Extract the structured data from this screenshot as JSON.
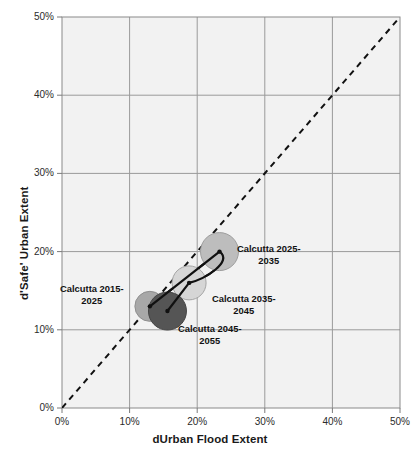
{
  "chart_data": {
    "type": "scatter",
    "title": "",
    "xlabel": "dUrban Flood Extent",
    "ylabel": "d'Safe' Urban Extent",
    "xlim": [
      0,
      50
    ],
    "ylim": [
      0,
      50
    ],
    "xticks": [
      "0%",
      "10%",
      "20%",
      "30%",
      "40%",
      "50%"
    ],
    "yticks": [
      "0%",
      "10%",
      "20%",
      "30%",
      "40%",
      "50%"
    ],
    "xtick_values": [
      0,
      10,
      20,
      30,
      40,
      50
    ],
    "ytick_values": [
      0,
      10,
      20,
      30,
      40,
      50
    ],
    "grid": true,
    "legend": "none",
    "units": "percent",
    "reference_line": {
      "name": "one-to-one-line",
      "style": "dashed",
      "from": [
        0,
        0
      ],
      "to": [
        50,
        50
      ]
    },
    "connector": {
      "name": "trajectory-path",
      "style": "solid",
      "order": [
        "Calcutta 2015-2025",
        "Calcutta 2025-2035",
        "Calcutta 2035-2045",
        "Calcutta 2045-2055"
      ]
    },
    "points": [
      {
        "label": "Calcutta 2015-2025",
        "label_line1": "Calcutta 2015-",
        "label_line2": "2025",
        "x": 13.0,
        "y": 13.0,
        "radius_px": 15,
        "fill": "#a8a8a8",
        "stroke": "#8f8f8f",
        "label_x_px": 60,
        "label_y_px": 283,
        "label_align": "center"
      },
      {
        "label": "Calcutta 2025-2035",
        "label_line1": "Calcutta 2025-",
        "label_line2": "2035",
        "x": 23.3,
        "y": 20.0,
        "radius_px": 19,
        "fill": "#bdbdbd",
        "stroke": "#9e9e9e",
        "label_x_px": 237,
        "label_y_px": 243,
        "label_align": "left"
      },
      {
        "label": "Calcutta 2035-2045",
        "label_line1": "Calcutta 2035-",
        "label_line2": "2045",
        "x": 18.8,
        "y": 16.0,
        "radius_px": 17,
        "fill": "#d6d6d6",
        "stroke": "#a5a5a5",
        "label_x_px": 212,
        "label_y_px": 293,
        "label_align": "left"
      },
      {
        "label": "Calcutta 2045-2055",
        "label_line1": "Calcutta 2045-",
        "label_line2": "2055",
        "x": 15.6,
        "y": 12.4,
        "radius_px": 19,
        "fill": "#555555",
        "stroke": "#444444",
        "label_x_px": 178,
        "label_y_px": 323,
        "label_align": "left"
      }
    ],
    "colors": {
      "plot_background": "#f2f2f2",
      "grid_line": "#9a9a9a",
      "axis_line": "#7a7a7a",
      "text": "#1a1a1a"
    }
  },
  "caption": {
    "text": ""
  }
}
